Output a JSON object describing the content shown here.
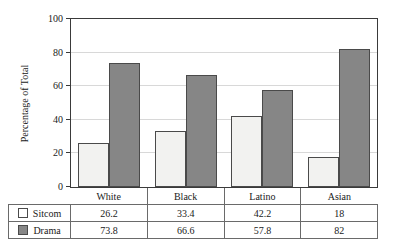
{
  "chart_data": {
    "type": "bar",
    "title": "",
    "xlabel": "",
    "ylabel": "Percentage of Total",
    "categories": [
      "White",
      "Black",
      "Latino",
      "Asian"
    ],
    "series": [
      {
        "name": "Sitcom",
        "values": [
          26.2,
          33.4,
          42.2,
          18
        ],
        "color": "#f2f2f0"
      },
      {
        "name": "Drama",
        "values": [
          73.8,
          66.6,
          57.8,
          82
        ],
        "color": "#868686"
      }
    ],
    "ylim": [
      0,
      100
    ],
    "yticks": [
      0,
      20,
      40,
      60,
      80,
      100
    ],
    "ytick_labels": [
      "0",
      "20",
      "40",
      "60",
      "80",
      "100"
    ],
    "grid": "horizontal",
    "legend_position": "table-left-column"
  },
  "table": {
    "corner_label": "",
    "column_headers": [
      "White",
      "Black",
      "Latino",
      "Asian"
    ],
    "rows": [
      {
        "label": "Sitcom",
        "cells": [
          "26.2",
          "33.4",
          "42.2",
          "18"
        ]
      },
      {
        "label": "Drama",
        "cells": [
          "73.8",
          "66.6",
          "57.8",
          "82"
        ]
      }
    ]
  }
}
